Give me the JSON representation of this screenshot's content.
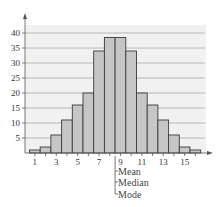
{
  "chart_data": {
    "type": "bar",
    "title": "",
    "xlabel": "",
    "ylabel": "",
    "categories": [
      1,
      2,
      3,
      4,
      5,
      6,
      7,
      8,
      9,
      10,
      11,
      12,
      13,
      14,
      15,
      16
    ],
    "values": [
      1,
      2,
      6,
      11,
      16,
      20,
      34,
      38.5,
      38.5,
      34,
      20,
      16,
      11,
      6,
      2,
      1
    ],
    "ylim": [
      0,
      43
    ],
    "xlim": [
      0.5,
      17
    ],
    "y_ticks": [
      5,
      10,
      15,
      20,
      25,
      30,
      35,
      40
    ],
    "x_ticks": [
      1,
      3,
      5,
      7,
      9,
      11,
      13,
      15
    ],
    "grid": true,
    "legend": null,
    "annotations": [
      {
        "x": 8.5,
        "labels": [
          "Mean",
          "Median",
          "Mode"
        ]
      }
    ]
  },
  "colors": {
    "bar_fill": "#c6c6c6",
    "bar_stroke": "#3c3c3c",
    "panel_bg": "#f1f1f1",
    "grid": "#a8a8a8",
    "axis": "#555555"
  },
  "annotation": {
    "mean_label": "Mean",
    "median_label": "Median",
    "mode_label": "Mode"
  }
}
